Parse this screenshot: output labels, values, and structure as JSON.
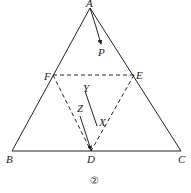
{
  "figure": {
    "caption": "②",
    "points": {
      "A": {
        "label": "A",
        "x": 90,
        "y": 8
      },
      "B": {
        "label": "B",
        "x": 12,
        "y": 151
      },
      "C": {
        "label": "C",
        "x": 181,
        "y": 151
      },
      "D": {
        "label": "D",
        "x": 91,
        "y": 151
      },
      "E": {
        "label": "E",
        "x": 134,
        "y": 75
      },
      "F": {
        "label": "F",
        "x": 53,
        "y": 75
      },
      "P": {
        "label": "P",
        "x": 101,
        "y": 45
      }
    },
    "segments": {
      "solid": [
        "AB",
        "BC",
        "CA"
      ],
      "dashed": [
        "FE",
        "FD",
        "ED"
      ]
    },
    "vectors": [
      {
        "name": "AP",
        "from": "A",
        "to": "P"
      },
      {
        "name": "YX",
        "from_label": "Y",
        "to_label": "X"
      },
      {
        "name": "ZD",
        "from_label": "Z",
        "to": "D"
      }
    ],
    "labels": {
      "Y": "Y",
      "X": "X",
      "Z": "Z"
    },
    "colors": {
      "line": "#222222",
      "background": "#ffffff"
    }
  }
}
